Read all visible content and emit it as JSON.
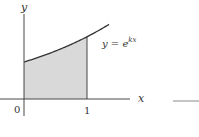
{
  "chart_data": {
    "type": "area",
    "title": "",
    "xlabel": "x",
    "ylabel": "y",
    "function_label": {
      "base": "y = e",
      "exponent": "kx"
    },
    "xlim": [
      0,
      1.35
    ],
    "ylim": [
      0,
      2.2
    ],
    "x_ticks": [
      {
        "value": 0,
        "label": "0"
      },
      {
        "value": 1,
        "label": "1"
      }
    ],
    "curve": {
      "expression": "e^{kx}",
      "k": 0.52,
      "x_start": 0,
      "x_end": 1.35
    },
    "shaded_region": {
      "x_from": 0,
      "x_to": 1,
      "description": "area under y = e^{kx} from 0 to 1"
    },
    "grid": false,
    "legend": "none",
    "colors": {
      "axis": "#333333",
      "curve": "#333333",
      "fill": "#d9d9d9",
      "dash": "#8a8a8a"
    }
  }
}
